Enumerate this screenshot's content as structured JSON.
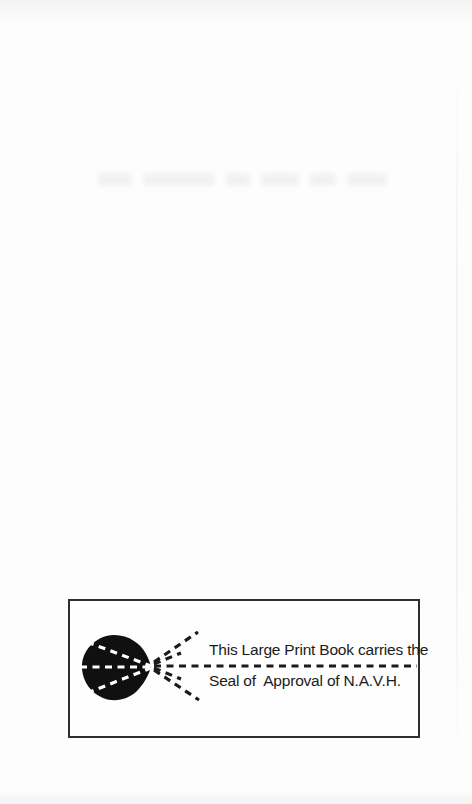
{
  "page": {
    "kind": "scanned book flyleaf",
    "background_color": "#fdfdfd"
  },
  "seal_box": {
    "line1": "This Large Print Book carries the",
    "line2": "Seal of  Approval of N.A.V.H.",
    "border_color": "#2e2e2e",
    "ink_color": "#1a1a1a",
    "icon": "navh-eye-seal-icon"
  }
}
